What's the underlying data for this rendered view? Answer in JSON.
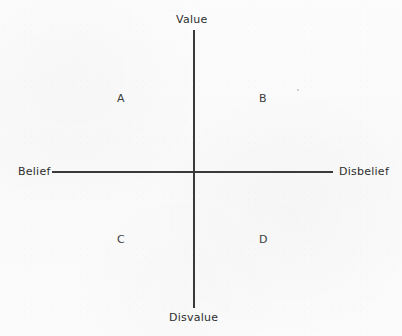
{
  "diagram": {
    "axes": {
      "vertical": {
        "top_label": "Value",
        "bottom_label": "Disvalue"
      },
      "horizontal": {
        "left_label": "Belief",
        "right_label": "Disbelief"
      }
    },
    "quadrants": [
      {
        "id": "A",
        "label": "A",
        "position": "upper-left",
        "meaning": "Belief + Value"
      },
      {
        "id": "B",
        "label": "B",
        "position": "upper-right",
        "meaning": "Disbelief + Value"
      },
      {
        "id": "C",
        "label": "C",
        "position": "lower-left",
        "meaning": "Belief + Disvalue"
      },
      {
        "id": "D",
        "label": "D",
        "position": "lower-right",
        "meaning": "Disbelief + Disvalue"
      }
    ],
    "colors": {
      "background": "#fbfbfb",
      "axis_line": "#3a3a3a",
      "axis_text": "#2e2e2e",
      "quadrant_text": "#3c3c3c"
    }
  }
}
